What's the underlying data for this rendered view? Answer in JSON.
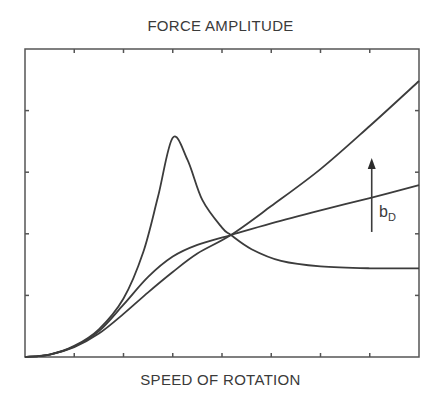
{
  "chart_data": {
    "type": "line",
    "title": "FORCE AMPLITUDE",
    "xlabel": "SPEED OF ROTATION",
    "ylabel": "",
    "xlim": [
      0,
      8
    ],
    "ylim": [
      0,
      5
    ],
    "x_ticks": [
      0,
      1,
      2,
      3,
      4,
      5,
      6,
      7,
      8
    ],
    "y_ticks": [
      0,
      1,
      2,
      3,
      4,
      5
    ],
    "tick_labels_shown": false,
    "grid": false,
    "legend": null,
    "series": [
      {
        "name": "low damping",
        "x": [
          0,
          0.5,
          1,
          1.5,
          2,
          2.4,
          2.7,
          3.0,
          3.3,
          3.6,
          4.0,
          4.18,
          4.6,
          5.2,
          6.0,
          7.0,
          8.0
        ],
        "y": [
          0,
          0.04,
          0.18,
          0.45,
          0.95,
          1.7,
          2.6,
          3.56,
          3.2,
          2.55,
          2.1,
          1.98,
          1.75,
          1.56,
          1.47,
          1.44,
          1.44
        ]
      },
      {
        "name": "medium damping",
        "x": [
          0,
          0.5,
          1,
          1.5,
          2,
          2.5,
          3.0,
          3.5,
          4.18,
          5,
          6,
          7,
          8
        ],
        "y": [
          0,
          0.04,
          0.17,
          0.42,
          0.85,
          1.3,
          1.63,
          1.82,
          1.98,
          2.17,
          2.38,
          2.58,
          2.79
        ]
      },
      {
        "name": "high damping",
        "x": [
          0,
          0.5,
          1,
          1.5,
          2,
          2.5,
          3.0,
          3.5,
          4.18,
          5,
          6,
          7,
          8
        ],
        "y": [
          0,
          0.04,
          0.16,
          0.38,
          0.7,
          1.05,
          1.38,
          1.68,
          1.98,
          2.45,
          3.05,
          3.75,
          4.48
        ]
      }
    ],
    "annotations": [
      {
        "type": "arrow",
        "direction": "up",
        "x": 7.04,
        "y_from": 2.03,
        "y_to": 3.23,
        "label": "b",
        "label_subscript": "D",
        "meaning": "increasing damping"
      }
    ]
  },
  "labels": {
    "title": "FORCE AMPLITUDE",
    "xlabel": "SPEED OF ROTATION",
    "annotation_main": "b",
    "annotation_sub": "D"
  }
}
